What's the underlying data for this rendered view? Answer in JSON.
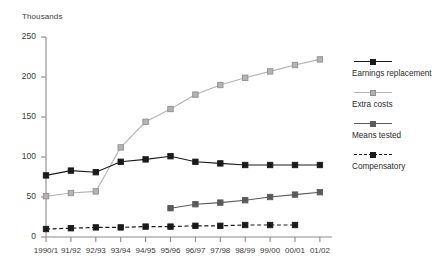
{
  "chart_data": {
    "type": "line",
    "title": "",
    "subtitle": "",
    "xlabel": "",
    "ylabel": "Thousands",
    "axis_unit_label": "Thousands",
    "categories": [
      "1990/1",
      "91/92",
      "92/93",
      "93/94",
      "94/95",
      "95/96",
      "96/97",
      "97/98",
      "98/99",
      "99/00",
      "00/01",
      "01/02"
    ],
    "ylim": [
      0,
      250
    ],
    "yticks": [
      0,
      50,
      100,
      150,
      200,
      250
    ],
    "ytick_labels": [
      "0",
      "50",
      "100",
      "150",
      "200",
      "250"
    ],
    "grid": false,
    "legend_position": "right",
    "series": [
      {
        "name": "Earnings replacement",
        "color": "#1a1a1a",
        "marker": "filled-square",
        "line_style": "solid",
        "values": [
          77,
          83,
          81,
          94,
          97,
          101,
          94,
          92,
          90,
          90,
          90,
          90
        ]
      },
      {
        "name": "Extra costs",
        "color": "#b3b3b3",
        "marker": "open-square",
        "line_style": "solid",
        "values": [
          51,
          55,
          57,
          112,
          144,
          160,
          178,
          190,
          199,
          207,
          215,
          222
        ]
      },
      {
        "name": "Means tested",
        "color": "#5a5a5a",
        "marker": "filled-square",
        "line_style": "solid",
        "values": [
          null,
          null,
          null,
          null,
          null,
          36,
          41,
          43,
          46,
          50,
          53,
          56
        ]
      },
      {
        "name": "Compensatory",
        "color": "#1a1a1a",
        "marker": "filled-square",
        "line_style": "dashed",
        "values": [
          10,
          11,
          12,
          12,
          13,
          13,
          14,
          14,
          15,
          15,
          15,
          null
        ]
      }
    ]
  },
  "legend": {
    "items": [
      {
        "label": "Earnings replacement"
      },
      {
        "label": "Extra costs"
      },
      {
        "label": "Means tested"
      },
      {
        "label": "Compensatory"
      }
    ]
  },
  "colors": {
    "axis": "#8a8a8a",
    "text": "#2b2b2b",
    "earnings_replacement": "#1a1a1a",
    "extra_costs": "#b3b3b3",
    "means_tested": "#5a5a5a",
    "compensatory": "#1a1a1a"
  }
}
